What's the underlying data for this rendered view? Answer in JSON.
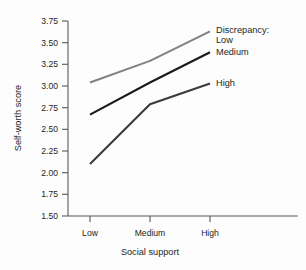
{
  "chart_data": {
    "type": "line",
    "title": "",
    "xlabel": "Social support",
    "ylabel": "Self-worth score",
    "categories": [
      "Low",
      "Medium",
      "High"
    ],
    "ylim": [
      1.5,
      3.75
    ],
    "yticks": [
      "1.50",
      "1.75",
      "2.00",
      "2.25",
      "2.50",
      "2.75",
      "3.00",
      "3.25",
      "3.50",
      "3.75"
    ],
    "ytick_values": [
      1.5,
      1.75,
      2.0,
      2.25,
      2.5,
      2.75,
      3.0,
      3.25,
      3.5,
      3.75
    ],
    "grid": false,
    "legend_position": "right-inline",
    "legend_title": "Discrepancy:",
    "series": [
      {
        "name": "Low",
        "values": [
          3.04,
          3.29,
          3.63
        ],
        "color": "#808285"
      },
      {
        "name": "Medium",
        "values": [
          2.67,
          3.04,
          3.39
        ],
        "color": "#1a1a1a"
      },
      {
        "name": "High",
        "values": [
          2.1,
          2.79,
          3.03
        ],
        "color": "#3b3b3d"
      }
    ]
  },
  "axes": {
    "y_title": "Self-worth score",
    "x_title": "Social support"
  },
  "legend": {
    "title": "Discrepancy:",
    "items": [
      {
        "label": "Low"
      },
      {
        "label": "Medium"
      },
      {
        "label": "High"
      }
    ]
  },
  "colors": {
    "axis": "#58595b",
    "text": "#231f20",
    "background": "#fdfdfd"
  }
}
